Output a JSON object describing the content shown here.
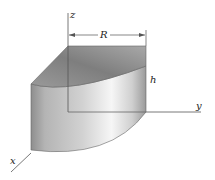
{
  "diagram": {
    "labels": {
      "z_axis": "z",
      "y_axis": "y",
      "x_axis": "x",
      "radius": "R",
      "height": "h"
    },
    "colors": {
      "background": "#ffffff",
      "axis": "#555555",
      "top_face_dark": "#7a7a7a",
      "top_face_light": "#b0b0b0",
      "side_dark": "#8c8c8c",
      "side_light": "#f4f4f4",
      "label": "#222222"
    }
  }
}
